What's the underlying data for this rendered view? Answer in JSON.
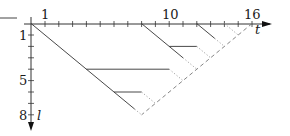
{
  "figure": {
    "type": "diagram",
    "colors": {
      "line": "#333333",
      "dotted": "#999999",
      "dashed": "#777777",
      "background": "#ffffff"
    },
    "axes": {
      "x": {
        "label": "t",
        "tick_labels": [
          {
            "value": 1,
            "text": "1"
          },
          {
            "value": 10,
            "text": "10"
          },
          {
            "value": 16,
            "text": "16"
          }
        ],
        "ticks": [
          1,
          2,
          3,
          4,
          5,
          6,
          7,
          8,
          9,
          10,
          11,
          12,
          13,
          14,
          15,
          16
        ]
      },
      "y": {
        "label": "l",
        "tick_labels": [
          {
            "value": 1,
            "text": "1"
          },
          {
            "value": 5,
            "text": "5"
          },
          {
            "value": 8,
            "text": "8"
          }
        ],
        "ticks": [
          1,
          2,
          3,
          4,
          5,
          6,
          7,
          8
        ]
      }
    },
    "segments": [
      {
        "style": "solid",
        "from": [
          0,
          0
        ],
        "to": [
          7.5,
          7.5
        ]
      },
      {
        "style": "dotted",
        "from": [
          7.5,
          7.5
        ],
        "to": [
          8,
          8
        ]
      },
      {
        "style": "solid",
        "from": [
          4,
          4
        ],
        "to": [
          10,
          4
        ]
      },
      {
        "style": "dotted",
        "from": [
          10,
          4
        ],
        "to": [
          11,
          5
        ]
      },
      {
        "style": "solid",
        "from": [
          6,
          6
        ],
        "to": [
          8,
          6
        ]
      },
      {
        "style": "dotted",
        "from": [
          8,
          6
        ],
        "to": [
          9,
          7
        ]
      },
      {
        "style": "solid",
        "from": [
          8,
          0
        ],
        "to": [
          11,
          3
        ]
      },
      {
        "style": "dotted",
        "from": [
          11,
          3
        ],
        "to": [
          12,
          4
        ]
      },
      {
        "style": "solid",
        "from": [
          10,
          2
        ],
        "to": [
          12,
          2
        ]
      },
      {
        "style": "dotted",
        "from": [
          12,
          2
        ],
        "to": [
          13,
          3
        ]
      },
      {
        "style": "solid",
        "from": [
          12,
          0
        ],
        "to": [
          13.3,
          1.3
        ]
      },
      {
        "style": "dotted",
        "from": [
          13.3,
          1.3
        ],
        "to": [
          14,
          2
        ]
      },
      {
        "style": "dotted",
        "from": [
          14,
          0
        ],
        "to": [
          15,
          1
        ]
      },
      {
        "style": "dashed",
        "from": [
          16,
          0
        ],
        "to": [
          8,
          8
        ]
      }
    ]
  }
}
